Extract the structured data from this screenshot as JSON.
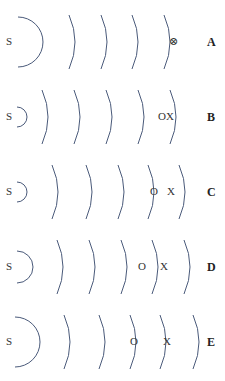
{
  "diagram": {
    "stroke_color": "#4a5a7a",
    "rows": [
      {
        "id": "A",
        "label": "A",
        "source": "S",
        "cy": 42,
        "src_r": 25,
        "src_x": 18,
        "arcs": [
          75,
          107,
          138,
          170
        ],
        "observers": [
          {
            "text": "⊗",
            "x": 169
          }
        ]
      },
      {
        "id": "B",
        "label": "B",
        "source": "S",
        "cy": 117,
        "src_r": 10,
        "src_x": 17,
        "arcs": [
          48,
          80,
          112,
          144,
          176
        ],
        "observers": [
          {
            "text": "OX",
            "x": 158
          }
        ]
      },
      {
        "id": "C",
        "label": "C",
        "source": "S",
        "cy": 192,
        "src_r": 10,
        "src_x": 17,
        "arcs": [
          58,
          92,
          124,
          154,
          185
        ],
        "observers": [
          {
            "text": "O",
            "x": 150
          },
          {
            "text": "X",
            "x": 167
          }
        ]
      },
      {
        "id": "D",
        "label": "D",
        "source": "S",
        "cy": 267,
        "src_r": 16,
        "src_x": 17,
        "arcs": [
          63,
          95,
          127,
          158,
          190
        ],
        "observers": [
          {
            "text": "O",
            "x": 138
          },
          {
            "text": "X",
            "x": 160
          }
        ]
      },
      {
        "id": "E",
        "label": "E",
        "source": "S",
        "cy": 342,
        "src_r": 25,
        "src_x": 15,
        "arcs": [
          70,
          105,
          136,
          166,
          199
        ],
        "observers": [
          {
            "text": "O",
            "x": 130
          },
          {
            "text": "X",
            "x": 163
          }
        ]
      }
    ]
  }
}
